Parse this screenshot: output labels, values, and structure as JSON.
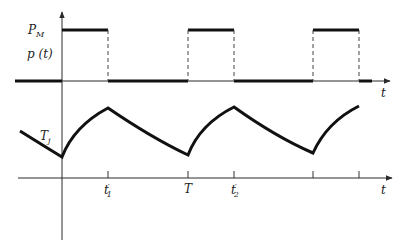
{
  "diagram": {
    "type": "timing-diagram",
    "upper_plot": {
      "signal_name": "p(t)",
      "level_label": "P",
      "level_label_subscript": "M",
      "y_axis_label": "p (t)",
      "x_axis_label": "t",
      "waveform": "rectangular pulse train",
      "levels": [
        "0",
        "P_M"
      ]
    },
    "lower_plot": {
      "curve_label": "T",
      "curve_label_subscript": "j",
      "x_axis_label": "t",
      "waveform": "exponential rise / decay sawtooth",
      "tick_labels": [
        {
          "text": "t",
          "prime": "′",
          "subscript": "1"
        },
        {
          "text": "T"
        },
        {
          "text": "t",
          "prime": "′",
          "subscript": "2"
        },
        {
          "text": ""
        },
        {
          "text": ""
        }
      ]
    },
    "colors": {
      "stroke": "#111111",
      "axis": "#2a2a2a",
      "dashed": "#444444",
      "background": "#ffffff"
    }
  }
}
